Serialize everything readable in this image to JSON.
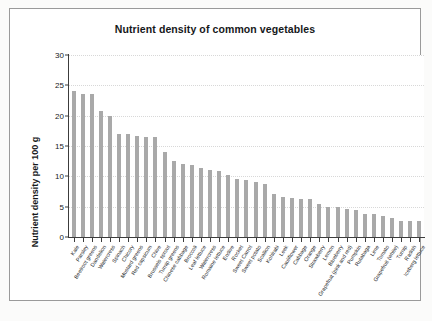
{
  "figure": {
    "title": "Nutrient density of common vegetables",
    "background_color": "#ffffff",
    "frame_color": "#9a9a9a",
    "bar_color": "#a9a9a9"
  },
  "chart_data": {
    "type": "bar",
    "title": "Nutrient density of common vegetables",
    "xlabel": "",
    "ylabel": "Nutrient density per 100 g",
    "ylim": [
      0,
      30
    ],
    "yticks": [
      0,
      5,
      10,
      15,
      20,
      25,
      30
    ],
    "grid": true,
    "legend": null,
    "categories": [
      "Kale",
      "Parsley",
      "Beetroot greens",
      "Dandelion",
      "Watercress",
      "Spinach",
      "Chicory",
      "Mustard greens",
      "Red capsicum",
      "Chive",
      "Brussels sprout",
      "Turnip greens",
      "Chinese cabbage",
      "Broccoli",
      "Leaf lettuce",
      "Watercress",
      "Romaine lettuce",
      "Endive",
      "Rocket",
      "Sweet Carrot",
      "Sweet potato",
      "Scallion",
      "Kohlrabi",
      "Leek",
      "Cauliflower",
      "Cabbage",
      "Orange",
      "Strawberry",
      "Lemon",
      "Blueberry",
      "Grapefruit (pink and red)",
      "Pumpkin",
      "Rutabaga",
      "Lime",
      "Tomato",
      "Grapefruit (white)",
      "Turnip",
      "Radish",
      "Iceberg lettuce"
    ],
    "values": [
      24.1,
      23.5,
      23.5,
      20.8,
      20.0,
      17.0,
      16.9,
      16.6,
      16.5,
      16.5,
      14.0,
      12.5,
      12.0,
      11.9,
      11.4,
      11.1,
      10.8,
      10.2,
      9.5,
      9.4,
      9.1,
      8.8,
      7.1,
      6.6,
      6.4,
      6.2,
      6.2,
      5.5,
      5.0,
      4.9,
      4.7,
      4.4,
      3.8,
      3.8,
      3.5,
      3.2,
      2.7,
      2.6,
      2.6
    ]
  }
}
